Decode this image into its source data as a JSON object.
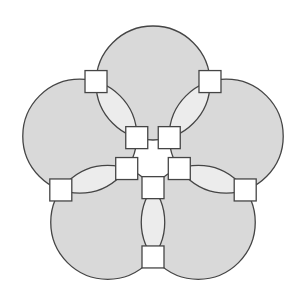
{
  "diagram": {
    "colors": {
      "background": "#ffffff",
      "circle_fill": "#d9d9d9",
      "lens_fill": "#ececec",
      "center_fill": "#ffffff",
      "stroke": "#454545",
      "node_fill": "#ffffff"
    },
    "circles": [
      {
        "id": "top"
      },
      {
        "id": "upper-right"
      },
      {
        "id": "lower-right"
      },
      {
        "id": "lower-left"
      },
      {
        "id": "upper-left"
      }
    ],
    "intersections": [
      {
        "between": [
          "top",
          "upper-right"
        ]
      },
      {
        "between": [
          "upper-right",
          "lower-right"
        ]
      },
      {
        "between": [
          "lower-right",
          "lower-left"
        ]
      },
      {
        "between": [
          "lower-left",
          "upper-left"
        ]
      },
      {
        "between": [
          "upper-left",
          "top"
        ]
      }
    ],
    "node_count": 10,
    "labels": []
  }
}
